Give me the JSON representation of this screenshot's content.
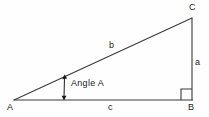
{
  "diagram": {
    "type": "right-triangle",
    "background_color": "#fefefe",
    "stroke_color": "#3a3a3a",
    "text_color": "#1a1a1a",
    "vertices": [
      {
        "name": "A",
        "label": "A",
        "x": 14,
        "y": 100,
        "role": "acute-angle-vertex"
      },
      {
        "name": "B",
        "label": "B",
        "x": 192,
        "y": 100,
        "role": "right-angle-vertex"
      },
      {
        "name": "C",
        "label": "C",
        "x": 192,
        "y": 18,
        "role": "acute-angle-vertex"
      }
    ],
    "sides": [
      {
        "name": "a",
        "label": "a",
        "from": "B",
        "to": "C",
        "description": "opposite side, vertical leg"
      },
      {
        "name": "b",
        "label": "b",
        "from": "A",
        "to": "C",
        "description": "hypotenuse"
      },
      {
        "name": "c",
        "label": "c",
        "from": "A",
        "to": "B",
        "description": "adjacent side, horizontal leg"
      }
    ],
    "angle_annotation": {
      "label": "Angle  A",
      "vertex": "A",
      "arrow": "double-headed-vertical"
    },
    "right_angle_marker": {
      "at": "B",
      "size": 11
    }
  }
}
